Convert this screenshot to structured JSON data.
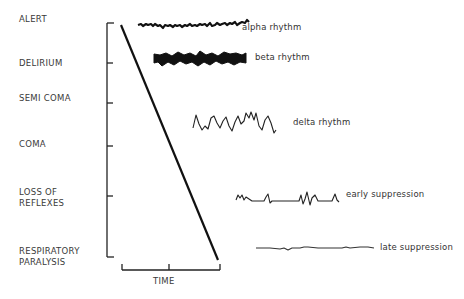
{
  "diagram": {
    "stages": [
      {
        "line1": "ALERT",
        "line2": ""
      },
      {
        "line1": "DELIRIUM",
        "line2": ""
      },
      {
        "line1": "SEMI COMA",
        "line2": ""
      },
      {
        "line1": "COMA",
        "line2": ""
      },
      {
        "line1": "LOSS OF",
        "line2": "REFLEXES"
      },
      {
        "line1": "RESPIRATORY",
        "line2": "PARALYSIS"
      }
    ],
    "x_axis_label": "TIME",
    "waveforms": [
      {
        "label": "alpha rhythm"
      },
      {
        "label": "beta rhythm"
      },
      {
        "label": "delta rhythm"
      },
      {
        "label": "early suppression"
      },
      {
        "label": "late suppression"
      }
    ],
    "colors": {
      "ink": "#1a1a1a",
      "background": "#ffffff"
    }
  }
}
